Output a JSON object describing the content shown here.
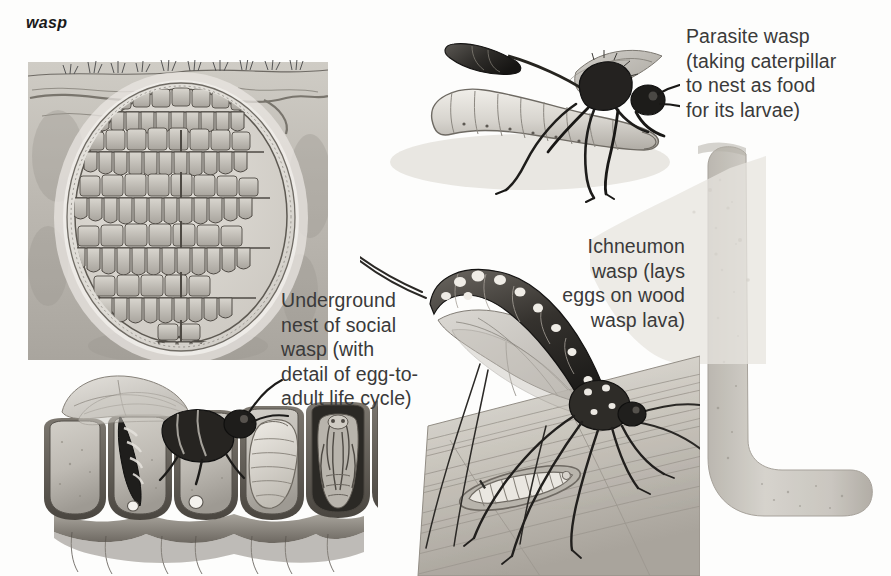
{
  "plate": {
    "title": "wasp",
    "width": 891,
    "height": 576,
    "background_color": "#fdfdfc",
    "ink_color": "#3a3a3a",
    "style": "black-and-white encyclopedia line-and-wash illustration plate"
  },
  "captions": [
    {
      "id": "parasite-wasp",
      "text": "Parasite wasp\n(taking caterpillar\nto nest as food\nfor its larvae)",
      "align": "left",
      "x": 686,
      "y": 24
    },
    {
      "id": "ichneumon-wasp",
      "text": "Ichneumon\nwasp (lays\neggs on wood\nwasp lava)",
      "align": "right",
      "x": 395,
      "y": 234,
      "width": 290
    },
    {
      "id": "underground-nest",
      "text": "Underground\nnest of social\nwasp (with\ndetail of egg-to-\nadult life cycle)",
      "align": "left",
      "x": 281,
      "y": 288
    }
  ],
  "figures": [
    {
      "id": "underground-nest-figure",
      "label": "Underground nest of social wasp, cut-away through soil",
      "parts": [
        "soil block cross-section",
        "grass tufts at ground surface",
        "tree roots in soil",
        "papery nest envelope",
        "seven tiers of hexagonal brood comb",
        "nest entrance hole at base"
      ],
      "comb_tiers": 7
    },
    {
      "id": "parasite-wasp-figure",
      "label": "Black parasite wasp standing over a pale caterpillar",
      "parts": [
        "wasp head with antennae",
        "thorax",
        "petiolate abdomen",
        "two wings",
        "six legs",
        "caterpillar prey"
      ]
    },
    {
      "id": "ichneumon-wasp-figure",
      "label": "Ichneumon wasp drilling ovipositor into a wooden log",
      "parts": [
        "long antennae",
        "spotted arched abdomen",
        "wings",
        "long legs",
        "ovipositor drilling into wood",
        "log with grain"
      ]
    },
    {
      "id": "life-cycle-figure",
      "label": "Detail of egg-to-adult life cycle in brood comb cells",
      "cells": [
        {
          "stage": "empty cell"
        },
        {
          "stage": "adult wasp laying egg"
        },
        {
          "stage": "egg in cell"
        },
        {
          "stage": "larva"
        },
        {
          "stage": "pupa"
        },
        {
          "stage": "emerging adult"
        },
        {
          "stage": "empty cell"
        }
      ]
    },
    {
      "id": "wood-tunnel-figure",
      "label": "L-shaped wood wasp tunnel bored through timber"
    },
    {
      "id": "wood-wasp-larva-figure",
      "label": "Wood wasp larva inside its tunnel in the log"
    }
  ],
  "colors": {
    "ink": "#3a3a3a",
    "line": "#4a4a4a",
    "soil_light": "#d6d3cc",
    "soil_mid": "#b9b5ae",
    "soil_dark": "#8f8b84",
    "nest_wall": "#e7e4de",
    "cell_fill": "#c9c6bf",
    "wasp_body": "#2a2a2a",
    "larva": "#e2e0da",
    "wood": "#cfcbc3",
    "tunnel": "#c4c0b8"
  }
}
